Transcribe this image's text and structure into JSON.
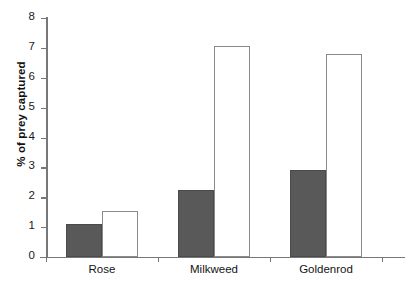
{
  "chart_data": {
    "type": "bar",
    "title": "",
    "subtitle": "",
    "xlabel": "",
    "ylabel": "% of prey captured",
    "ylim": [
      0,
      8
    ],
    "ytick_labels": [
      "0",
      "1",
      "2",
      "3",
      "4",
      "5",
      "6",
      "7",
      "8"
    ],
    "ytick_values": [
      0,
      1,
      2,
      3,
      4,
      5,
      6,
      7,
      8
    ],
    "grid": false,
    "legend": "none",
    "categories": [
      "Rose",
      "Milkweed",
      "Goldenrod"
    ],
    "series": [
      {
        "name": "dark-series",
        "color": "#595959",
        "values": [
          1.1,
          2.25,
          2.9
        ]
      },
      {
        "name": "light-series",
        "color": "#ffffff",
        "values": [
          1.55,
          7.05,
          6.8
        ]
      }
    ],
    "annotations": []
  },
  "axis": {
    "y_title": "% of prey captured",
    "ticks": [
      {
        "label": "8",
        "value": 8
      },
      {
        "label": "7",
        "value": 7
      },
      {
        "label": "6",
        "value": 6
      },
      {
        "label": "5",
        "value": 5
      },
      {
        "label": "4",
        "value": 4
      },
      {
        "label": "3",
        "value": 3
      },
      {
        "label": "2",
        "value": 2
      },
      {
        "label": "1",
        "value": 1
      },
      {
        "label": "0",
        "value": 0
      }
    ]
  },
  "colors": {
    "dark_bar": "#595959",
    "light_bar": "#ffffff",
    "bar_outline": "#8a8a8a",
    "axis": "#777777",
    "text": "#141414",
    "background": "#ffffff"
  }
}
